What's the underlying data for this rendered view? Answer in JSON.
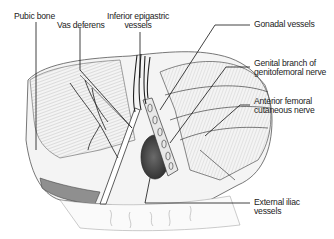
{
  "figure": {
    "labels": [
      {
        "id": "pubic-bone",
        "lines": [
          "Pubic bone"
        ]
      },
      {
        "id": "vas-deferens",
        "lines": [
          "Vas deferens"
        ]
      },
      {
        "id": "inferior-epigastric",
        "lines": [
          "Inferior epigastric",
          "vessels"
        ]
      },
      {
        "id": "gonadal-vessels",
        "lines": [
          "Gonadal vessels"
        ]
      },
      {
        "id": "genital-branch",
        "lines": [
          "Genital branch of",
          "genitofemoral nerve"
        ]
      },
      {
        "id": "anterior-femoral",
        "lines": [
          "Anterior femoral",
          "cutaneous nerve"
        ]
      },
      {
        "id": "external-iliac",
        "lines": [
          "External iliac",
          "vessels"
        ]
      }
    ]
  }
}
